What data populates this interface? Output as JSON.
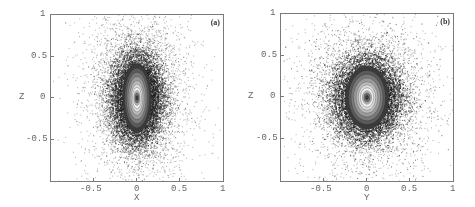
{
  "figure": {
    "panels": [
      {
        "tag": "(a)",
        "xlabel": "X",
        "ylabel": "Z",
        "xticks": [
          "-0.5",
          "0",
          "0.5",
          "1"
        ],
        "yticks": [
          "1",
          "0.5",
          "0",
          "-0.5"
        ]
      },
      {
        "tag": "(b)",
        "xlabel": "Y",
        "ylabel": "Z",
        "xticks": [
          "-0.5",
          "0",
          "0.5",
          "1"
        ],
        "yticks": [
          "1",
          "0.5",
          "0",
          "-0.5"
        ]
      }
    ]
  },
  "chart_data": [
    {
      "type": "scatter",
      "title": "(a)",
      "xlabel": "X",
      "ylabel": "Z",
      "xlim": [
        -1,
        1
      ],
      "ylim": [
        -1,
        1
      ],
      "xtick_values": [
        -0.5,
        0,
        0.5,
        1
      ],
      "ytick_values": [
        -0.5,
        0,
        0.5,
        1
      ],
      "grid": false,
      "legend": null,
      "description": "Dense particle scatter in X-Z projection with overlaid density contours; distribution elongated along Z (peanut/boxy shape), core centered at (0,0)",
      "distribution": {
        "center": [
          0,
          0
        ],
        "sigma_x": 0.17,
        "sigma_z": 0.3,
        "core_half_width_x": 0.08,
        "core_half_height_z": 0.2,
        "n_points_approx": 12000
      },
      "colors": {
        "points": "#222222",
        "contours": "#555555"
      }
    },
    {
      "type": "scatter",
      "title": "(b)",
      "xlabel": "Y",
      "ylabel": "Z",
      "xlim": [
        -1,
        1
      ],
      "ylim": [
        -1,
        1
      ],
      "xtick_values": [
        -0.5,
        0,
        0.5,
        1
      ],
      "ytick_values": [
        -0.5,
        0,
        0.5,
        1
      ],
      "grid": false,
      "legend": null,
      "description": "Dense particle scatter in Y-Z projection with overlaid density contours; roughly elliptical distribution slightly elongated along Z, core centered at (0,0)",
      "distribution": {
        "center": [
          0,
          0
        ],
        "sigma_x": 0.22,
        "sigma_z": 0.27,
        "core_half_width_x": 0.12,
        "core_half_height_z": 0.18,
        "n_points_approx": 12000
      },
      "colors": {
        "points": "#222222",
        "contours": "#555555"
      }
    }
  ]
}
